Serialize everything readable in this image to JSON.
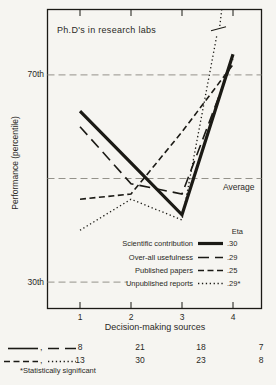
{
  "colors": {
    "ink": "#1b1a15",
    "grid": "#94928a",
    "paper": "#f6f5f1",
    "text": "#2a2925"
  },
  "chart_data": {
    "type": "line",
    "title": "Ph.D's in research labs",
    "xlabel": "Decision-making sources",
    "ylabel": "Performance (percentile)",
    "x_categories": [
      "1",
      "2",
      "3",
      "4"
    ],
    "y_axis": {
      "unit": "percentile",
      "ref_lines": [
        {
          "label": "70th",
          "percentile": 70,
          "extent": "full",
          "label_side": "left"
        },
        {
          "label": "Average",
          "percentile": 50,
          "extent": "full",
          "label_side": "inside-right"
        },
        {
          "label": "30th",
          "percentile": 30,
          "extent": "partial",
          "label_side": "left"
        }
      ]
    },
    "legend_header": "Eta",
    "series": [
      {
        "name": "Scientific contribution",
        "eta": ".30",
        "style": "solid-thick",
        "values": [
          63,
          53,
          43,
          74
        ]
      },
      {
        "name": "Over-all usefulness",
        "eta": ".29",
        "style": "long-dash",
        "values": [
          60,
          49,
          47,
          73
        ]
      },
      {
        "name": "Published papers",
        "eta": ".25",
        "style": "medium-dash",
        "values": [
          46,
          47,
          59,
          72
        ]
      },
      {
        "name": "Unpublished reports",
        "eta": ".29*",
        "style": "dotted",
        "values": [
          40,
          46,
          42
        ],
        "off_scale": {
          "exit_x": 3.78,
          "exit_percentile": 82.7,
          "note": "line exceeds top of scale, shown with break mark"
        }
      }
    ],
    "counts_table": {
      "rows": [
        {
          "styles": [
            "solid",
            "long-dash"
          ],
          "values": [
            "8",
            "21",
            "18",
            "7"
          ]
        },
        {
          "styles": [
            "medium-dash",
            "dotted"
          ],
          "values": [
            "13",
            "30",
            "23",
            "8"
          ]
        }
      ]
    },
    "footnote": "*Statistically significant"
  }
}
